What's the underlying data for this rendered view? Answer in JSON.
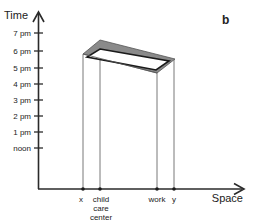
{
  "panel_label": "b",
  "axes": {
    "y_title": "Time",
    "x_title": "Space",
    "y_ticks": [
      "7 pm",
      "6 pm",
      "5 pm",
      "4 pm",
      "3 pm",
      "2 pm",
      "1 pm",
      "noon"
    ]
  },
  "places": [
    {
      "label": "x",
      "lines": [
        "x"
      ]
    },
    {
      "label": "child care center",
      "lines": [
        "child",
        "care",
        "center"
      ]
    },
    {
      "label": "work",
      "lines": [
        "work"
      ]
    },
    {
      "label": "y",
      "lines": [
        "y"
      ]
    }
  ],
  "colors": {
    "axis": "#2a2a2a",
    "prism_band": "#8a8a8a",
    "prism_edge": "#1a1a1a",
    "guide_line": "#555555"
  }
}
